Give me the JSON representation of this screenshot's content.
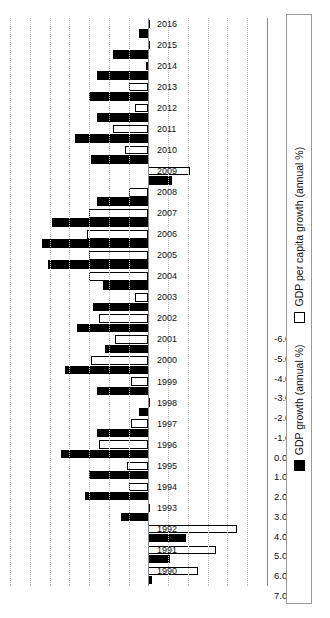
{
  "chart_data": {
    "type": "bar",
    "title": "",
    "subtitle": "",
    "xlabel": "",
    "ylabel": "",
    "orientation": "horizontal",
    "grid": true,
    "legend_position": "bottom",
    "categories": [
      "1990",
      "1991",
      "1992",
      "1993",
      "1994",
      "1995",
      "1996",
      "1997",
      "1998",
      "1999",
      "2000",
      "2001",
      "2002",
      "2003",
      "2004",
      "2005",
      "2006",
      "2007",
      "2008",
      "2009",
      "2010",
      "2011",
      "2012",
      "2013",
      "2014",
      "2015",
      "2016"
    ],
    "axis_ticks": [
      "7.0",
      "6.0",
      "5.0",
      "4.0",
      "3.0",
      "2.0",
      "1.0",
      "0.0",
      "-1.0",
      "-2.0",
      "-3.0",
      "-4.0",
      "-5.0",
      "-6.0"
    ],
    "axis_range": [
      7.0,
      -6.0
    ],
    "series": [
      {
        "name": "GDP growth (annual %)",
        "color": "#000000",
        "marker": "filled-square",
        "values": [
          -0.2,
          -1.1,
          -1.9,
          1.4,
          3.2,
          3.0,
          4.4,
          2.6,
          0.5,
          2.6,
          4.2,
          2.2,
          3.6,
          2.8,
          2.3,
          5.1,
          5.4,
          4.9,
          2.6,
          -1.2,
          2.9,
          3.7,
          2.6,
          3.0,
          2.6,
          1.8,
          0.5
        ]
      },
      {
        "name": "GDP per capita growth (annual %)",
        "color": "#ffffff",
        "marker": "hollow-square",
        "values": [
          -2.5,
          -3.4,
          -4.5,
          -0.1,
          1.0,
          1.1,
          2.5,
          0.9,
          -0.1,
          0.9,
          2.9,
          1.7,
          2.5,
          0.7,
          3.0,
          3.0,
          3.1,
          3.0,
          1.0,
          -2.1,
          1.2,
          1.8,
          0.7,
          1.0,
          0.1,
          0.0,
          0.0
        ]
      }
    ]
  },
  "legend": {
    "items": [
      {
        "label": "GDP growth (annual %)",
        "marker": "filled-square"
      },
      {
        "label": "GDP per capita growth (annual %)",
        "marker": "hollow-square"
      }
    ]
  }
}
